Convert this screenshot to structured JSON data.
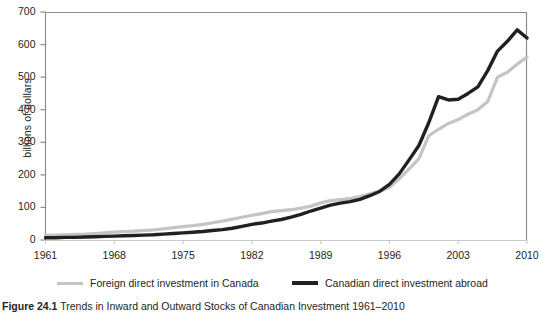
{
  "figure": {
    "caption_label": "Figure 24.1",
    "caption_text": "Trends in Inward and Outward Stocks of Canadian Investment 1961–2010"
  },
  "chart_data": {
    "type": "line",
    "title": "",
    "xlabel": "",
    "ylabel": "billions of dollars",
    "xlim": [
      1961,
      2010
    ],
    "ylim": [
      0,
      700
    ],
    "ytick_step": 100,
    "yticks": [
      0,
      100,
      200,
      300,
      400,
      500,
      600,
      700
    ],
    "ytick_labels": [
      "0",
      "100",
      "200",
      "300",
      "400",
      "500",
      "600",
      "700"
    ],
    "xticks": [
      1961,
      1968,
      1975,
      1982,
      1989,
      1996,
      2003,
      2010
    ],
    "xtick_labels": [
      "1961",
      "1968",
      "1975",
      "1982",
      "1989",
      "1996",
      "2003",
      "2010"
    ],
    "grid": false,
    "legend_position": "bottom",
    "colors": {
      "foreign_direct_investment_in_canada": "#c4c4c4",
      "canadian_direct_investment_abroad": "#231f20",
      "axis": "#8c8c8c",
      "text": "#231f20"
    },
    "x": [
      1961,
      1962,
      1963,
      1964,
      1965,
      1966,
      1967,
      1968,
      1969,
      1970,
      1971,
      1972,
      1973,
      1974,
      1975,
      1976,
      1977,
      1978,
      1979,
      1980,
      1981,
      1982,
      1983,
      1984,
      1985,
      1986,
      1987,
      1988,
      1989,
      1990,
      1991,
      1992,
      1993,
      1994,
      1995,
      1996,
      1997,
      1998,
      1999,
      2000,
      2001,
      2002,
      2003,
      2004,
      2005,
      2006,
      2007,
      2008,
      2009,
      2010
    ],
    "series": [
      {
        "name": "Foreign direct investment in Canada",
        "color": "#c4c4c4",
        "width": 3.2,
        "values": [
          14,
          15,
          16,
          17,
          18,
          20,
          22,
          24,
          26,
          27,
          29,
          31,
          34,
          38,
          41,
          44,
          48,
          53,
          58,
          64,
          70,
          76,
          81,
          87,
          90,
          93,
          98,
          104,
          114,
          121,
          124,
          127,
          133,
          142,
          150,
          162,
          188,
          218,
          250,
          320,
          340,
          358,
          370,
          386,
          400,
          425,
          500,
          515,
          540,
          562
        ]
      },
      {
        "name": "Canadian direct investment abroad",
        "color": "#231f20",
        "width": 3.4,
        "values": [
          7,
          7,
          8,
          8,
          9,
          10,
          11,
          12,
          13,
          14,
          15,
          16,
          18,
          20,
          22,
          24,
          26,
          29,
          32,
          36,
          42,
          48,
          52,
          58,
          63,
          70,
          79,
          89,
          98,
          107,
          113,
          118,
          125,
          136,
          149,
          171,
          203,
          246,
          290,
          360,
          440,
          430,
          432,
          450,
          470,
          520,
          580,
          610,
          645,
          620
        ]
      }
    ]
  },
  "legend": {
    "items": [
      {
        "label": "Foreign direct investment in Canada",
        "color": "#c4c4c4"
      },
      {
        "label": "Canadian direct investment abroad",
        "color": "#231f20"
      }
    ]
  }
}
